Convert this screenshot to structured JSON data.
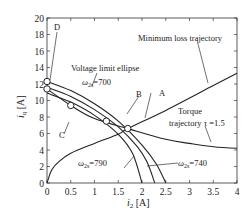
{
  "chart_data": {
    "type": "line",
    "title": "",
    "xlabel": "i2 [A]",
    "ylabel": "iq [A]",
    "xlim": [
      0,
      4
    ],
    "ylim": [
      0,
      20
    ],
    "x_ticks": [
      "0",
      "0.5",
      "1",
      "1.5",
      "2",
      "2.5",
      "3",
      "3.5",
      "4"
    ],
    "y_ticks": [
      "0",
      "2",
      "4",
      "6",
      "8",
      "10",
      "12",
      "14",
      "16",
      "18",
      "20"
    ],
    "grid": false,
    "series": [
      {
        "name": "Voltage limit ellipse ω2s=700",
        "x": [
          0,
          0.5,
          1.0,
          1.5,
          2.0,
          2.3,
          2.5
        ],
        "y": [
          12.3,
          11.2,
          9.6,
          7.5,
          4.6,
          2.3,
          0
        ]
      },
      {
        "name": "Voltage limit ellipse ω2s=740",
        "x": [
          0,
          0.5,
          1.0,
          1.5,
          1.9,
          2.1,
          2.27
        ],
        "y": [
          11.6,
          10.5,
          8.9,
          6.8,
          4.4,
          2.6,
          0
        ]
      },
      {
        "name": "Voltage limit ellipse ω2s=790",
        "x": [
          0,
          0.5,
          1.0,
          1.5,
          1.8,
          2.0
        ],
        "y": [
          10.9,
          9.8,
          8.2,
          5.9,
          3.6,
          0
        ]
      },
      {
        "name": "Minimum loss trajectory",
        "x": [
          0,
          0.1,
          0.25,
          0.5,
          1.0,
          1.5,
          1.7,
          2.5,
          3.5,
          4.0
        ],
        "y": [
          0,
          1.6,
          2.6,
          3.6,
          4.8,
          5.9,
          6.6,
          8.8,
          11.8,
          13.3
        ]
      },
      {
        "name": "Torque trajectory τ=1.5",
        "x": [
          0,
          0.5,
          1.0,
          1.7,
          2.5,
          3.0,
          3.5,
          4.0
        ],
        "y": [
          11.4,
          9.4,
          7.8,
          6.6,
          5.3,
          4.8,
          4.4,
          4.2
        ]
      }
    ],
    "points": [
      {
        "label": "A",
        "x": 1.7,
        "y": 6.6
      },
      {
        "label": "B",
        "x": 1.25,
        "y": 7.5
      },
      {
        "label": "C",
        "x": 0.5,
        "y": 9.4
      },
      {
        "label": "D",
        "x": 0.0,
        "y": 12.3
      }
    ],
    "annotations": [
      "Minimum loss trajectory",
      "Voltage limit ellipse",
      "ω2s=700",
      "ω2s=740",
      "ω2s=790",
      "Torque",
      "trajectory τ =1.5"
    ]
  },
  "labels": {
    "xlabel": "i",
    "xlabel_sub": "2",
    "xlabel_unit": " [A]",
    "ylabel": "i",
    "ylabel_sub": "q",
    "ylabel_unit": " [A]",
    "min_loss": "Minimum loss trajectory",
    "volt_limit": "Voltage limit ellipse",
    "w700_pre": "ω",
    "w700_sub": "2s",
    "w700_val": "=700",
    "w740_pre": "ω",
    "w740_sub": "2s",
    "w740_val": "=740",
    "w790_pre": "ω",
    "w790_sub": "2s",
    "w790_val": "=790",
    "torque_1": "Torque",
    "torque_2": "trajectory τ =1.5",
    "pt_a": "A",
    "pt_b": "B",
    "pt_c": "C",
    "pt_d": "D",
    "x_ticks": [
      "0",
      "0.5",
      "1",
      "1.5",
      "2",
      "2.5",
      "3",
      "3.5",
      "4"
    ],
    "y_ticks": [
      "0",
      "2",
      "4",
      "6",
      "8",
      "10",
      "12",
      "14",
      "16",
      "18",
      "20"
    ]
  }
}
